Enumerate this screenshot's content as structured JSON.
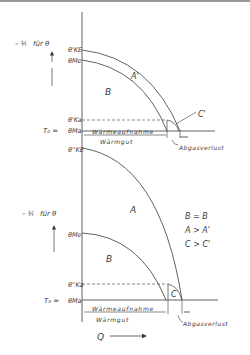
{
  "upper_diagram": {
    "y_axis_label": "-1/T für θ",
    "y_axis_label_parts": {
      "fraction": "- ¹⁄ₜ",
      "text": "für θ"
    },
    "ticks": {
      "theta_KE_prime": "θ'KE",
      "theta_Me": "θMe",
      "theta_Ka_prime": "θ'Ka",
      "theta_Ma": "θMa",
      "T0_eq": "T₀ ="
    },
    "regions": {
      "A": "A'",
      "B": "B",
      "C": "C'"
    },
    "bracket_top": "Wärmeaufnahme",
    "bracket_bottom": "Wärmgut",
    "loss_label": "Abgasverlust"
  },
  "lower_diagram": {
    "y_axis_label": "-1/T für θ",
    "ticks": {
      "theta_KE_dprime": "θ''KE",
      "theta_Me": "θMe",
      "theta_Ka_dprime": "θ''Ka",
      "theta_Ma": "θMa",
      "T0_eq": "T₀ ="
    },
    "regions": {
      "A": "A",
      "B": "B",
      "C": "C"
    },
    "relations": [
      "B = B",
      "A > A'",
      "C > C'"
    ],
    "bracket_top": "Wärmeaufnahme",
    "bracket_bottom": "Wärmgut",
    "loss_label": "Abgasverlust"
  },
  "x_axis": {
    "label": "Q"
  },
  "colors": {
    "line": "#3a3a3a",
    "background": "#ffffff"
  }
}
